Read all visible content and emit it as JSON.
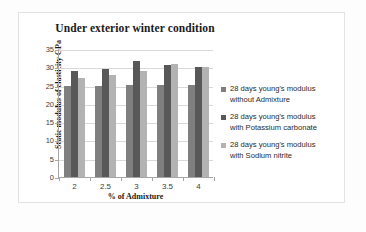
{
  "chart_data": {
    "type": "bar",
    "title": "Under exterior winter condition",
    "xlabel": "% of Admixture",
    "ylabel": "Static modulus of elasticity GPa",
    "categories": [
      "2",
      "2.5",
      "3",
      "3.5",
      "4"
    ],
    "ylim": [
      0,
      35
    ],
    "yticks": [
      "0",
      "5",
      "10",
      "15",
      "20",
      "25",
      "30",
      "35"
    ],
    "grid": true,
    "legend_position": "right",
    "series": [
      {
        "name": "28 days young's modulus without Admixture",
        "name_line1": "28 days young's modulus",
        "name_line2": "without Admixture",
        "color": "#7f7f7f",
        "values": [
          25,
          25,
          25.2,
          25.2,
          25.2
        ]
      },
      {
        "name": "28 days young's modulus with Potassium carbonate",
        "name_line1": "28 days young's modulus",
        "name_line2": "with Potassium carbonate",
        "color": "#585858",
        "values": [
          29,
          29.5,
          31.8,
          30.5,
          30
        ]
      },
      {
        "name": "28 days young's modulus with Sodium nitrite",
        "name_line1": "28 days young's modulus",
        "name_line2": "with Sodium nitrite",
        "color": "#b3b3b3",
        "values": [
          27,
          28,
          29,
          31,
          30.2
        ]
      }
    ]
  }
}
